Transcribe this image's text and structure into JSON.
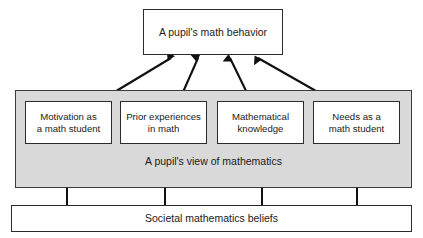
{
  "diagram": {
    "colors": {
      "band_fill": "#d9d9d9",
      "box_fill": "#ffffff",
      "stroke": "#2b2b2b",
      "text": "#1a1a1a"
    },
    "behavior_box": {
      "label": "A pupil's math behavior"
    },
    "view_band": {
      "label": "A pupil's view of mathematics"
    },
    "factors": [
      {
        "label": "Motivation as\na math student"
      },
      {
        "label": "Prior experiences\nin math"
      },
      {
        "label": "Mathematical\nknowledge"
      },
      {
        "label": "Needs as a\nmath student"
      }
    ],
    "societal_box": {
      "label": "Societal mathematics beliefs"
    },
    "arrows": {
      "factor_to_behavior": [
        {
          "from": "Motivation as a math student",
          "to": "A pupil's math behavior"
        },
        {
          "from": "Prior experiences in math",
          "to": "A pupil's math behavior"
        },
        {
          "from": "Mathematical knowledge",
          "to": "A pupil's math behavior"
        },
        {
          "from": "Needs as a math student",
          "to": "A pupil's math behavior"
        }
      ],
      "societal_to_view": [
        {
          "from": "Societal mathematics beliefs",
          "to": "A pupil's view of mathematics"
        },
        {
          "from": "Societal mathematics beliefs",
          "to": "A pupil's view of mathematics"
        },
        {
          "from": "Societal mathematics beliefs",
          "to": "A pupil's view of mathematics"
        },
        {
          "from": "Societal mathematics beliefs",
          "to": "A pupil's view of mathematics"
        }
      ]
    }
  }
}
